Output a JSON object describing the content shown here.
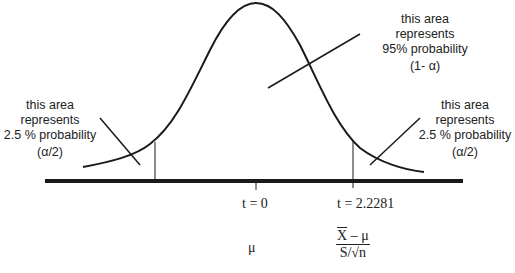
{
  "diagram": {
    "labels": {
      "center": {
        "line1": "this area",
        "line2": "represents",
        "line3": "95% probability",
        "line4": "(1- α)"
      },
      "left_tail": {
        "line1": "this area",
        "line2": "represents",
        "line3": "2.5 % probability",
        "line4": "(α/2)"
      },
      "right_tail": {
        "line1": "this area",
        "line2": "represents",
        "line3": "2.5 % probability",
        "line4": "(α/2)"
      }
    },
    "axis": {
      "tick_center_label": "t = 0",
      "tick_critical_label": "t = 2.2281",
      "mu_label": "μ",
      "formula": {
        "numerator_xbar": "X",
        "numerator_rest": " – μ",
        "denominator_s": "S/√",
        "denominator_n": "n"
      }
    },
    "values": {
      "center_probability": "95%",
      "tail_probability": "2.5 %",
      "critical_t": 2.2281
    },
    "colors": {
      "stroke": "#1a1a1a",
      "text": "#222222",
      "background": "#ffffff"
    }
  }
}
